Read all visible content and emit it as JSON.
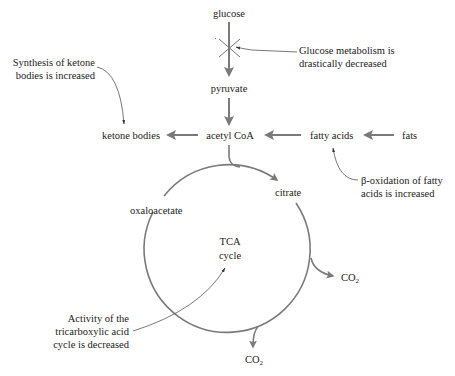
{
  "diagram": {
    "nodes": {
      "glucose": "glucose",
      "pyruvate": "pyruvate",
      "acetyl_coa": "acetyl CoA",
      "ketone_bodies": "ketone bodies",
      "fatty_acids": "fatty acids",
      "fats": "fats",
      "citrate": "citrate",
      "oxaloacetate": "oxaloacetate",
      "tca_line1": "TCA",
      "tca_line2": "cycle",
      "co2_right": "CO",
      "co2_right_sub": "2",
      "co2_bottom": "CO",
      "co2_bottom_sub": "2"
    },
    "annotations": {
      "glucose_line1": "Glucose metabolism is",
      "glucose_line2": "drastically decreased",
      "ketone_line1": "Synthesis of ketone",
      "ketone_line2": "bodies is increased",
      "beta_line1": "β-oxidation of fatty",
      "beta_line2": "acids is increased",
      "tca_note_line1": "Activity of the",
      "tca_note_line2": "tricarboxylic acid",
      "tca_note_line3": "cycle is decreased"
    },
    "colors": {
      "arrow": "#7a7a7a",
      "thin_arrow": "#555555",
      "text": "#222222"
    }
  }
}
